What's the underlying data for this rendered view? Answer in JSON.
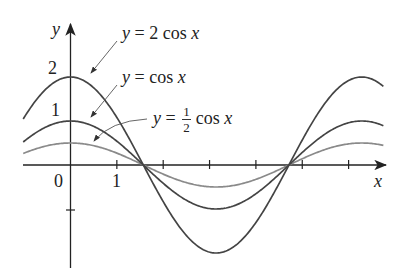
{
  "chart_data": {
    "type": "line",
    "title": "",
    "xlabel": "x",
    "ylabel": "y",
    "x_ticks": [
      1,
      2,
      3,
      4,
      5,
      6
    ],
    "x_tick_labels": {
      "origin": "0",
      "one": "1"
    },
    "y_tick_labels": [
      "1",
      "2"
    ],
    "y_ticks": [
      -1,
      1,
      2
    ],
    "xlim": [
      -1.02,
      6.75
    ],
    "ylim": [
      -2.2,
      2.1
    ],
    "grid": false,
    "series": [
      {
        "name": "y = 2 cos x",
        "amplitude": 2,
        "function": "2*cos(x)",
        "color": "#444444"
      },
      {
        "name": "y = cos x",
        "amplitude": 1,
        "function": "cos(x)",
        "color": "#444444"
      },
      {
        "name": "y = 1/2 cos x",
        "amplitude": 0.5,
        "function": "0.5*cos(x)",
        "color": "#8a8a8a"
      }
    ],
    "annotations": [
      {
        "text": "y = 2 cos x",
        "points_to": "2cos x curve near x≈0.5"
      },
      {
        "text": "y = cos x",
        "points_to": "cos x curve near x≈0.5"
      },
      {
        "text": "y = 1/2 cos x",
        "points_to": "1/2 cos x curve near x≈0.5"
      }
    ]
  },
  "labels": {
    "y_axis": "y",
    "x_axis": "x",
    "origin": "0",
    "x_one": "1",
    "y_one": "1",
    "y_two": "2",
    "eq1_y": "y",
    "eq1_rest": " = 2 cos ",
    "eq1_x": "x",
    "eq2_y": "y",
    "eq2_rest": " = cos ",
    "eq2_x": "x",
    "eq3_y": "y",
    "eq3_eq": " = ",
    "eq3_num": "1",
    "eq3_den": "2",
    "eq3_cos": "cos ",
    "eq3_x": "x"
  }
}
